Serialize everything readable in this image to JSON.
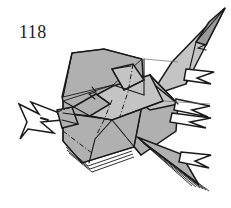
{
  "figure": {
    "kind": "origami-diagram",
    "step_number": "118",
    "background_color": "#ffffff",
    "paper_fill": "#b0b0b0",
    "paper_fill_shaded": "#9a9a9a",
    "paper_fill_light": "#c4c4c4",
    "paper_white": "#ffffff",
    "line_color": "#1a1a1a",
    "caption": ""
  },
  "shapes": {
    "head_label": "beak-and-crest",
    "body_label": "main-body-panel",
    "wing_upper_label": "upper-wing",
    "wing_lower_label": "lower-wing",
    "tail_label": "layered-tail",
    "talon_upper_label": "upper-talon",
    "talon_lower_label": "lower-talon"
  }
}
